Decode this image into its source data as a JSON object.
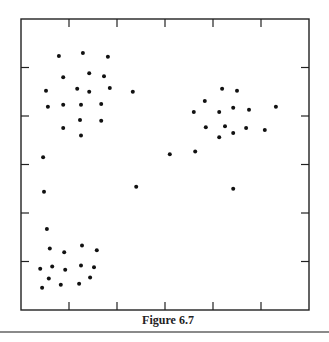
{
  "figure": {
    "caption": "Figure 6.7"
  },
  "colors": {
    "frame": "#222222",
    "point": "#111111",
    "rule": "#8a8a8a"
  },
  "chart_data": {
    "type": "scatter",
    "title": "",
    "xlabel": "",
    "ylabel": "",
    "xlim": [
      0,
      6
    ],
    "ylim": [
      0,
      6
    ],
    "grid": false,
    "legend": null,
    "tick_labels": {
      "x": [],
      "y": []
    },
    "x_ticks": [
      1,
      2,
      3,
      4,
      5
    ],
    "y_ticks": [
      1,
      2,
      3,
      4,
      5
    ],
    "caption": "Figure 6.7",
    "series": [
      {
        "name": "upper-left cluster",
        "points": [
          [
            0.79,
            5.24
          ],
          [
            1.29,
            5.3
          ],
          [
            1.81,
            5.22
          ],
          [
            0.88,
            4.8
          ],
          [
            1.42,
            4.88
          ],
          [
            1.73,
            4.82
          ],
          [
            0.52,
            4.52
          ],
          [
            1.17,
            4.56
          ],
          [
            1.42,
            4.5
          ],
          [
            1.85,
            4.58
          ],
          [
            0.56,
            4.19
          ],
          [
            0.88,
            4.23
          ],
          [
            1.25,
            4.23
          ],
          [
            1.67,
            4.25
          ],
          [
            1.23,
            3.92
          ],
          [
            1.67,
            3.9
          ],
          [
            0.88,
            3.75
          ],
          [
            1.25,
            3.6
          ]
        ]
      },
      {
        "name": "upper-right cluster",
        "points": [
          [
            4.19,
            4.56
          ],
          [
            4.5,
            4.52
          ],
          [
            3.83,
            4.31
          ],
          [
            3.6,
            4.08
          ],
          [
            4.13,
            4.08
          ],
          [
            4.42,
            4.17
          ],
          [
            4.75,
            4.13
          ],
          [
            5.31,
            4.19
          ],
          [
            3.85,
            3.77
          ],
          [
            4.25,
            3.79
          ],
          [
            4.69,
            3.75
          ],
          [
            5.08,
            3.71
          ],
          [
            4.13,
            3.56
          ],
          [
            4.42,
            3.65
          ]
        ]
      },
      {
        "name": "lower-left cluster",
        "points": [
          [
            0.54,
            1.67
          ],
          [
            0.6,
            1.27
          ],
          [
            0.9,
            1.19
          ],
          [
            1.27,
            1.33
          ],
          [
            1.58,
            1.23
          ],
          [
            0.4,
            0.85
          ],
          [
            0.65,
            0.9
          ],
          [
            0.92,
            0.83
          ],
          [
            1.25,
            0.92
          ],
          [
            1.52,
            0.88
          ],
          [
            0.58,
            0.65
          ],
          [
            1.44,
            0.67
          ],
          [
            0.44,
            0.46
          ],
          [
            0.83,
            0.52
          ],
          [
            1.21,
            0.54
          ]
        ]
      },
      {
        "name": "outliers",
        "points": [
          [
            0.46,
            3.15
          ],
          [
            0.48,
            2.44
          ],
          [
            2.33,
            4.5
          ],
          [
            2.4,
            2.54
          ],
          [
            3.1,
            3.21
          ],
          [
            3.63,
            3.27
          ],
          [
            4.42,
            2.5
          ]
        ]
      }
    ]
  }
}
